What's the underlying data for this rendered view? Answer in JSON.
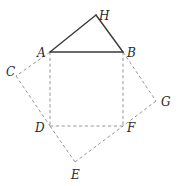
{
  "diagram": {
    "type": "geometry-figure",
    "points": {
      "H": {
        "x": 96,
        "y": 15
      },
      "A": {
        "x": 50,
        "y": 52
      },
      "B": {
        "x": 123,
        "y": 52
      },
      "C": {
        "x": 16,
        "y": 76
      },
      "D": {
        "x": 50,
        "y": 126
      },
      "F": {
        "x": 123,
        "y": 126
      },
      "G": {
        "x": 156,
        "y": 101
      },
      "E": {
        "x": 75,
        "y": 162
      }
    },
    "labels": {
      "H": "H",
      "A": "A",
      "B": "B",
      "C": "C",
      "D": "D",
      "F": "F",
      "G": "G",
      "E": "E"
    },
    "solid_segments": [
      [
        "A",
        "H"
      ],
      [
        "H",
        "B"
      ],
      [
        "A",
        "B"
      ]
    ],
    "dashed_segments": [
      [
        "A",
        "D"
      ],
      [
        "B",
        "F"
      ],
      [
        "D",
        "F"
      ],
      [
        "A",
        "C"
      ],
      [
        "C",
        "D"
      ],
      [
        "B",
        "G"
      ],
      [
        "G",
        "F"
      ],
      [
        "D",
        "E"
      ],
      [
        "E",
        "F"
      ]
    ],
    "colors": {
      "solid": "#3a3a3a",
      "dashed": "#8a8a8a",
      "label": "#2a2a2a"
    }
  }
}
